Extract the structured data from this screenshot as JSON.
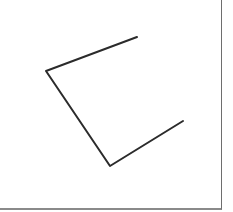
{
  "figure": {
    "stroke_color": "#2b2b2b",
    "border_color": "#6e6e6e",
    "background": "#ffffff",
    "polyline_points": [
      [
        137,
        37
      ],
      [
        46,
        71
      ],
      [
        110,
        166
      ],
      [
        183,
        121
      ]
    ]
  }
}
